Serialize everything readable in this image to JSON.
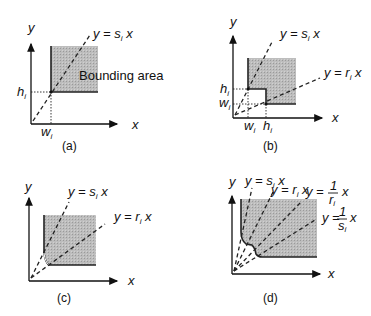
{
  "figure": {
    "panels": [
      {
        "id": "a",
        "caption": "(a)",
        "axis_x": "x",
        "axis_y": "y",
        "line_labels": [
          "y = s",
          "i",
          " x"
        ],
        "area_label": "Bounding area",
        "tick_x": [
          "w",
          "i"
        ],
        "tick_y": [
          "h",
          "i"
        ]
      },
      {
        "id": "b",
        "caption": "(b)",
        "axis_x": "x",
        "axis_y": "y",
        "line1": [
          "y = s",
          "i",
          " x"
        ],
        "line2": [
          "y = r",
          "i",
          " x"
        ],
        "tick_x1": [
          "w",
          "i"
        ],
        "tick_x2": [
          "h",
          "i"
        ],
        "tick_y1": [
          "h",
          "i"
        ],
        "tick_y2": [
          "w",
          "i"
        ]
      },
      {
        "id": "c",
        "caption": "(c)",
        "axis_x": "x",
        "axis_y": "y",
        "line1": [
          "y = s",
          "i",
          " x"
        ],
        "line2": [
          "y = r",
          "i",
          " x"
        ]
      },
      {
        "id": "d",
        "caption": "(d)",
        "axis_x": "x",
        "axis_y": "y",
        "line1": [
          "y = s",
          "i",
          " x"
        ],
        "line2": [
          "y = r",
          "i",
          " x"
        ],
        "line3": {
          "prefix": "y =",
          "num": "1",
          "den": "r",
          "den_sub": "i",
          "suffix": "x"
        },
        "line4": {
          "prefix": "y =",
          "num": "1",
          "den": "s",
          "den_sub": "i",
          "suffix": "x"
        }
      }
    ]
  }
}
